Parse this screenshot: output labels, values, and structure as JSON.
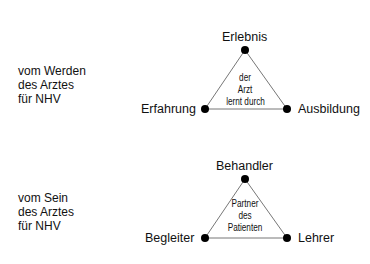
{
  "diagrams": [
    {
      "side_label": [
        "vom Werden",
        "des Arztes",
        "für NHV"
      ],
      "vertices": {
        "top": "Erlebnis",
        "left": "Erfahrung",
        "right": "Ausbildung"
      },
      "center": [
        "der",
        "Arzt",
        "lernt durch"
      ]
    },
    {
      "side_label": [
        "vom Sein",
        "des Arztes",
        "für NHV"
      ],
      "vertices": {
        "top": "Behandler",
        "left": "Begleiter",
        "right": "Lehrer"
      },
      "center": [
        "Partner",
        "des",
        "Patienten"
      ]
    }
  ]
}
